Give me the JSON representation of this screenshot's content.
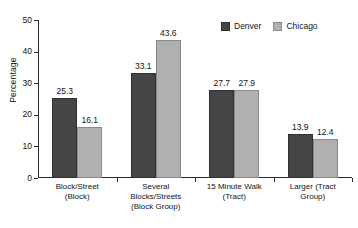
{
  "chart_data": {
    "type": "bar",
    "title": "",
    "xlabel": "",
    "ylabel": "Percentage",
    "ylim": [
      0,
      50
    ],
    "yticks": [
      0,
      10,
      20,
      30,
      40,
      50
    ],
    "ytick_labels": [
      "0",
      "10",
      "20",
      "30",
      "40",
      "50"
    ],
    "grid": false,
    "legend_position": "top-right",
    "categories": [
      "Block/Street\n(Block)",
      "Several\nBlocks/Streets\n(Block Group)",
      "15 Minute Walk\n(Tract)",
      "Larger (Tract\nGroup)"
    ],
    "category_lines": [
      [
        "Block/Street",
        "(Block)"
      ],
      [
        "Several",
        "Blocks/Streets",
        "(Block Group)"
      ],
      [
        "15 Minute Walk",
        "(Tract)"
      ],
      [
        "Larger (Tract",
        "Group)"
      ]
    ],
    "series": [
      {
        "name": "Denver",
        "color": "#454545",
        "values": [
          25.3,
          33.1,
          27.7,
          13.9
        ],
        "value_labels": [
          "25.3",
          "33.1",
          "27.7",
          "13.9"
        ]
      },
      {
        "name": "Chicago",
        "color": "#b0b0b0",
        "values": [
          16.1,
          43.6,
          27.9,
          12.4
        ],
        "value_labels": [
          "16.1",
          "43.6",
          "27.9",
          "12.4"
        ]
      }
    ]
  },
  "legend": {
    "items": [
      {
        "label": "Denver",
        "swatch": "denver"
      },
      {
        "label": "Chicago",
        "swatch": "chicago"
      }
    ]
  },
  "axis": {
    "y_title": "Percentage"
  },
  "colors": {
    "denver": "#454545",
    "chicago": "#b0b0b0",
    "axis": "#2b2b2b",
    "text": "#141414",
    "background": "#ffffff"
  }
}
